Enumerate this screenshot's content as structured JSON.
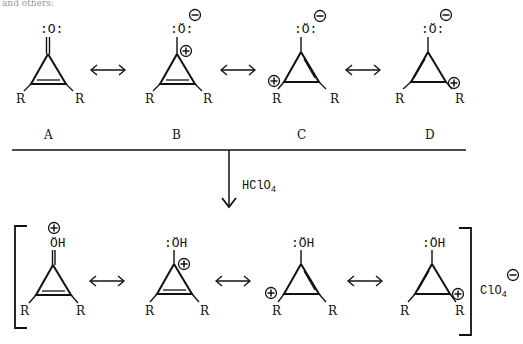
{
  "figure": {
    "top_fragment": "and others:",
    "top_row": {
      "structures": [
        {
          "label": "A",
          "oxygen": ":O:",
          "substituent_left": "R",
          "substituent_right": "R",
          "charges": []
        },
        {
          "label": "B",
          "oxygen": ":Ö:",
          "substituent_left": "R",
          "substituent_right": "R",
          "charges": [
            "O minus",
            "C1 plus"
          ]
        },
        {
          "label": "C",
          "oxygen": ":Ö:",
          "substituent_left": "R",
          "substituent_right": "R",
          "charges": [
            "O minus",
            "C2 plus"
          ]
        },
        {
          "label": "D",
          "oxygen": ":Ö:",
          "substituent_left": "R",
          "substituent_right": "R",
          "charges": [
            "O minus",
            "C3 plus"
          ]
        }
      ],
      "labels": [
        "A",
        "B",
        "C",
        "D"
      ]
    },
    "reagent": {
      "text": "HClO",
      "subscript": "4"
    },
    "bottom_row": {
      "structures": [
        {
          "group": "ÖH",
          "prefix": "",
          "substituent_left": "R",
          "substituent_right": "R",
          "charges": [
            "O plus"
          ]
        },
        {
          "group": "ÖH",
          "prefix": ":",
          "substituent_left": "R",
          "substituent_right": "R",
          "charges": [
            "C1 plus"
          ]
        },
        {
          "group": "ÖH",
          "prefix": ":",
          "substituent_left": "R",
          "substituent_right": "R",
          "charges": [
            "C2 plus"
          ]
        },
        {
          "group": "ÖH",
          "prefix": ":",
          "substituent_left": "R",
          "substituent_right": "R",
          "charges": [
            "C3 plus"
          ]
        }
      ],
      "counterion": {
        "text": "ClO",
        "subscript": "4",
        "charge": "minus"
      }
    },
    "symbols": {
      "resonance_arrow": "↔",
      "plus": "+",
      "minus": "−"
    }
  }
}
